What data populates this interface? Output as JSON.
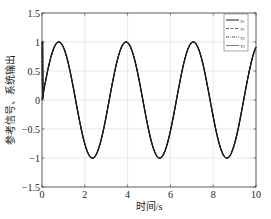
{
  "chart_data": {
    "type": "line",
    "title": "",
    "xlabel": "时间/s",
    "ylabel": "参考信号、系统输出",
    "xlim": [
      0,
      10
    ],
    "ylim": [
      -1.5,
      1.5
    ],
    "xticks": [
      0,
      2,
      4,
      6,
      8,
      10
    ],
    "xtick_labels": [
      "0",
      "2",
      "4",
      "6",
      "8",
      "10"
    ],
    "yticks": [
      -1.5,
      -1,
      -0.5,
      0,
      0.5,
      1,
      1.5
    ],
    "ytick_labels": [
      "-1.5",
      "-1",
      "-0.5",
      "0",
      "0.5",
      "1",
      "1.5"
    ],
    "grid": true,
    "legend_position": "upper right",
    "series": [
      {
        "name": "yr",
        "style": "solid",
        "function": "sin(2t)",
        "x": [
          0,
          0.79,
          2.36,
          3.93,
          5.5,
          7.07,
          8.64,
          10
        ],
        "values": [
          0,
          1,
          -1,
          1,
          -1,
          1,
          -1,
          0.91
        ]
      },
      {
        "name": "y1",
        "style": "dashed",
        "function": "sin(2t) with initial transient from 1",
        "x": [
          0,
          0.05,
          0.79,
          2.36,
          3.93,
          5.5,
          7.07,
          8.64,
          10
        ],
        "values": [
          1,
          0,
          1,
          -1,
          1,
          -1,
          1,
          -1,
          0.91
        ]
      },
      {
        "name": "y2",
        "style": "dash-dot",
        "function": "sin(2t) with initial transient from 1",
        "x": [
          0,
          0.05,
          0.79,
          2.36,
          3.93,
          5.5,
          7.07,
          8.64,
          10
        ],
        "values": [
          1,
          0,
          1,
          -1,
          1,
          -1,
          1,
          -1,
          0.91
        ]
      },
      {
        "name": "y3",
        "style": "solid",
        "function": "sin(2t) with initial transient from 1",
        "x": [
          0,
          0.05,
          0.79,
          2.36,
          3.93,
          5.5,
          7.07,
          8.64,
          10
        ],
        "values": [
          1,
          0,
          1,
          -1,
          1,
          -1,
          1,
          -1,
          0.91
        ]
      }
    ]
  },
  "labels": {
    "xlabel": "时间/s",
    "ylabel": "参考信号、系统输出",
    "legend": [
      {
        "base": "y",
        "sub": "r"
      },
      {
        "base": "y",
        "sub": "1"
      },
      {
        "base": "y",
        "sub": "2"
      },
      {
        "base": "y",
        "sub": "3"
      }
    ]
  },
  "colors": {
    "line": "#1a1a1a",
    "grid": "#d9d9d9",
    "axis": "#333333"
  }
}
